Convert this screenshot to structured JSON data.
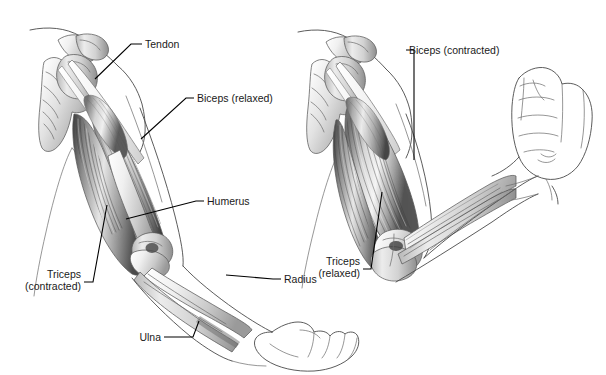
{
  "figure": {
    "background_color": "#ffffff",
    "label_text_color": "#1a1a1a",
    "leader_line_color": "#000000",
    "outline_color": "#4a4a4a",
    "width": 606,
    "height": 375
  },
  "panels": [
    {
      "id": "arm-extended",
      "name": "extended-arm-panel",
      "description": "Arm extended downward, triceps contracted, biceps relaxed",
      "hand": "open-hand"
    },
    {
      "id": "arm-flexed",
      "name": "flexed-arm-panel",
      "description": "Arm flexed at elbow, biceps contracted, triceps relaxed",
      "hand": "clenched-fist"
    }
  ],
  "labels": [
    {
      "id": "tendon",
      "name": "label-tendon",
      "line1": "Tendon",
      "line2": "",
      "align": "left",
      "panel": "arm-extended"
    },
    {
      "id": "biceps-relaxed",
      "name": "label-biceps-relaxed",
      "line1": "Biceps (relaxed)",
      "line2": "",
      "align": "left",
      "panel": "arm-extended"
    },
    {
      "id": "humerus",
      "name": "label-humerus",
      "line1": "Humerus",
      "line2": "",
      "align": "left",
      "panel": "arm-extended"
    },
    {
      "id": "triceps-contracted",
      "name": "label-triceps-contracted",
      "line1": "Triceps",
      "line2": "(contracted)",
      "align": "right",
      "panel": "arm-extended"
    },
    {
      "id": "ulna",
      "name": "label-ulna",
      "line1": "Ulna",
      "line2": "",
      "align": "right",
      "panel": "arm-extended"
    },
    {
      "id": "radius",
      "name": "label-radius",
      "line1": "Radius",
      "line2": "",
      "align": "left",
      "panel": "arm-extended"
    },
    {
      "id": "biceps-contracted",
      "name": "label-biceps-contracted",
      "line1": "Biceps (contracted)",
      "line2": "",
      "align": "left",
      "panel": "arm-flexed"
    },
    {
      "id": "triceps-relaxed",
      "name": "label-triceps-relaxed",
      "line1": "Triceps",
      "line2": "(relaxed)",
      "align": "right",
      "panel": "arm-flexed"
    }
  ]
}
